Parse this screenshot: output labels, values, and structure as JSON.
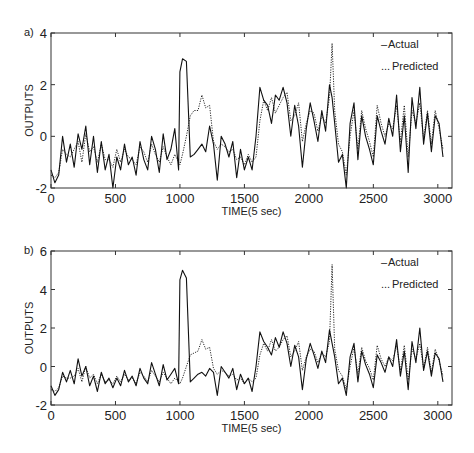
{
  "chart_data": [
    {
      "type": "line",
      "panel_label": "a)",
      "xlabel": "TIME(5 sec)",
      "ylabel": "OUTPUTS",
      "xlim": [
        0,
        3110
      ],
      "ylim": [
        -2,
        4
      ],
      "xticks": [
        0,
        500,
        1000,
        1500,
        2000,
        2500,
        3000
      ],
      "yticks": [
        -2,
        0,
        2,
        4
      ],
      "legend": {
        "placement": "top-right",
        "entries": [
          "Actual",
          "Predicted"
        ]
      },
      "legend_markers": [
        "–",
        "..."
      ],
      "x": [
        0,
        30,
        60,
        90,
        120,
        150,
        180,
        210,
        240,
        270,
        300,
        330,
        360,
        390,
        420,
        450,
        480,
        510,
        540,
        570,
        600,
        630,
        660,
        690,
        720,
        750,
        780,
        810,
        840,
        870,
        900,
        930,
        960,
        990,
        1000,
        1020,
        1050,
        1080,
        1110,
        1140,
        1170,
        1200,
        1230,
        1260,
        1290,
        1320,
        1350,
        1380,
        1410,
        1440,
        1470,
        1500,
        1530,
        1560,
        1590,
        1620,
        1650,
        1680,
        1710,
        1740,
        1770,
        1800,
        1830,
        1860,
        1890,
        1920,
        1950,
        1980,
        2010,
        2040,
        2070,
        2100,
        2130,
        2160,
        2180,
        2200,
        2230,
        2260,
        2290,
        2320,
        2350,
        2380,
        2410,
        2440,
        2470,
        2500,
        2530,
        2560,
        2590,
        2620,
        2650,
        2680,
        2710,
        2740,
        2770,
        2800,
        2830,
        2860,
        2890,
        2920,
        2950,
        2980,
        3010,
        3040
      ],
      "series": [
        {
          "name": "Actual",
          "style": "solid",
          "values": [
            -1.3,
            -1.8,
            -1.5,
            0,
            -1,
            -0.3,
            -1.2,
            0.1,
            -0.5,
            0.4,
            -1.1,
            0,
            -1.4,
            -0.2,
            -1.3,
            -0.7,
            -2.0,
            -0.8,
            -1.3,
            -0.3,
            -1.1,
            -0.8,
            -1.5,
            -0.2,
            -0.9,
            -1.3,
            0,
            -0.5,
            -1.4,
            0.1,
            -0.9,
            -0.5,
            0.3,
            -1.3,
            2.5,
            3.0,
            2.9,
            -0.8,
            -0.7,
            -0.5,
            -0.3,
            -0.6,
            0.4,
            -0.3,
            -1.7,
            0,
            -0.3,
            -0.8,
            -0.2,
            -1.6,
            -0.5,
            -1.3,
            -0.8,
            -1.3,
            0,
            1.9,
            1.4,
            1.2,
            0.5,
            1.6,
            1.4,
            1.9,
            1.3,
            0,
            1.2,
            0.4,
            -1.2,
            0.3,
            1.3,
            0.6,
            -0.2,
            1.0,
            0.2,
            2.0,
            1.5,
            0.5,
            -1.0,
            -0.7,
            -2.0,
            0.5,
            1.3,
            -0.9,
            0.8,
            0,
            -0.5,
            -1.1,
            0.8,
            0.2,
            -0.3,
            0.7,
            0,
            1.6,
            -0.6,
            0.8,
            -1.4,
            1.5,
            0.3,
            1.9,
            -0.3,
            0.9,
            -0.6,
            0.8,
            0.5,
            -0.8
          ]
        },
        {
          "name": "Predicted",
          "style": "dotted",
          "values": [
            -1.5,
            -1.6,
            -1.4,
            -0.5,
            -0.7,
            -0.8,
            -0.5,
            -0.2,
            -1,
            0.1,
            -0.6,
            -0.4,
            -1.0,
            -0.3,
            -0.9,
            -0.9,
            -1.2,
            -0.5,
            -1.0,
            -0.5,
            -0.8,
            -0.9,
            -1.1,
            -0.4,
            -0.6,
            -1.0,
            -0.3,
            -0.7,
            -1.0,
            -0.4,
            -0.8,
            -1.1,
            -0.7,
            -1.0,
            -1.1,
            -0.7,
            0,
            0.8,
            1.0,
            1.0,
            1.6,
            1.1,
            1.2,
            -0.2,
            -0.5,
            -0.3,
            -0.4,
            -0.6,
            -0.5,
            -0.9,
            -0.8,
            -1.1,
            -0.7,
            -1.0,
            -0.8,
            0.6,
            1.4,
            1.0,
            1.5,
            0.9,
            1.2,
            1.5,
            1.7,
            0.6,
            0.8,
            1.3,
            -0.2,
            0.5,
            1.0,
            0.9,
            0.2,
            0.8,
            0.5,
            1.5,
            3.6,
            1.0,
            -0.3,
            -0.6,
            -1.5,
            0,
            1.0,
            -0.5,
            1.0,
            0.3,
            -0.2,
            -0.8,
            1.2,
            0.5,
            0,
            0.5,
            0.3,
            1.2,
            -0.2,
            1.2,
            -0.8,
            1.0,
            0.5,
            1.3,
            -0.1,
            1.0,
            -0.3,
            1.0,
            0.3,
            -0.5
          ]
        }
      ]
    },
    {
      "type": "line",
      "panel_label": "b)",
      "xlabel": "TIME(5 sec)",
      "ylabel": "OUTPUTS",
      "xlim": [
        0,
        3110
      ],
      "ylim": [
        -2,
        6
      ],
      "xticks": [
        0,
        500,
        1000,
        1500,
        2000,
        2500,
        3000
      ],
      "yticks": [
        -2,
        0,
        2,
        4,
        6
      ],
      "legend": {
        "placement": "top-right",
        "entries": [
          "Actual",
          "Predicted"
        ]
      },
      "legend_markers": [
        "–",
        "..."
      ],
      "x": [
        0,
        30,
        60,
        90,
        120,
        150,
        180,
        210,
        240,
        270,
        300,
        330,
        360,
        390,
        420,
        450,
        480,
        510,
        540,
        570,
        600,
        630,
        660,
        690,
        720,
        750,
        780,
        810,
        840,
        870,
        900,
        930,
        960,
        990,
        1000,
        1020,
        1050,
        1080,
        1110,
        1140,
        1170,
        1200,
        1230,
        1260,
        1290,
        1320,
        1350,
        1380,
        1410,
        1440,
        1470,
        1500,
        1530,
        1560,
        1590,
        1620,
        1650,
        1680,
        1710,
        1740,
        1770,
        1800,
        1830,
        1860,
        1890,
        1920,
        1950,
        1980,
        2010,
        2040,
        2070,
        2100,
        2130,
        2160,
        2180,
        2200,
        2230,
        2260,
        2290,
        2320,
        2350,
        2380,
        2410,
        2440,
        2470,
        2500,
        2530,
        2560,
        2590,
        2620,
        2650,
        2680,
        2710,
        2740,
        2770,
        2800,
        2830,
        2860,
        2890,
        2920,
        2950,
        2980,
        3010,
        3040
      ],
      "series": [
        {
          "name": "Actual",
          "style": "solid",
          "values": [
            -1.0,
            -1.5,
            -1.2,
            -0.3,
            -0.8,
            -0.2,
            -0.9,
            0.4,
            -0.5,
            0,
            -1.0,
            -0.5,
            -1.3,
            -0.3,
            -0.9,
            -0.6,
            -1.1,
            -0.6,
            -1.0,
            -0.2,
            -0.8,
            -0.5,
            -1.0,
            -0.1,
            -0.6,
            -0.9,
            0.2,
            -0.4,
            -1.0,
            0.1,
            -0.7,
            -0.4,
            -0.1,
            -0.9,
            4.5,
            5.0,
            4.6,
            -0.8,
            -0.6,
            -0.4,
            -0.3,
            -0.5,
            -0.1,
            -0.3,
            -1.5,
            0,
            -0.3,
            -0.6,
            -0.1,
            -1.2,
            -0.4,
            -0.9,
            -0.6,
            -1.3,
            0,
            1.8,
            1.3,
            1.0,
            0.6,
            1.5,
            1.0,
            1.8,
            1.2,
            0,
            1.1,
            0.5,
            -1.2,
            0.4,
            1.2,
            0.6,
            -0.1,
            0.8,
            0.2,
            1.9,
            1.2,
            0.5,
            -0.9,
            -0.6,
            -1.5,
            0.5,
            1.2,
            -0.8,
            0.8,
            0.1,
            -0.4,
            -1.1,
            0.6,
            0.2,
            -0.3,
            0.5,
            0,
            1.4,
            -0.5,
            0.8,
            -1.2,
            1.3,
            0.2,
            2.0,
            -0.2,
            0.8,
            -0.5,
            0.7,
            0.4,
            -0.8
          ]
        },
        {
          "name": "Predicted",
          "style": "dotted",
          "values": [
            -1.2,
            -1.3,
            -1.1,
            -0.5,
            -0.6,
            -0.6,
            -0.5,
            -0.1,
            -0.8,
            0,
            -0.6,
            -0.4,
            -0.9,
            -0.4,
            -0.8,
            -0.7,
            -0.9,
            -0.5,
            -0.8,
            -0.4,
            -0.7,
            -0.6,
            -0.9,
            -0.3,
            -0.5,
            -0.8,
            -0.2,
            -0.5,
            -0.8,
            -0.3,
            -0.6,
            -0.9,
            -0.6,
            -0.8,
            -0.9,
            -0.6,
            0,
            0.6,
            0.7,
            0.8,
            1.4,
            0.9,
            1.0,
            -0.1,
            -0.4,
            -0.2,
            -0.3,
            -0.5,
            -0.4,
            -0.7,
            -0.6,
            -0.9,
            -0.6,
            -0.8,
            -0.6,
            0.6,
            1.2,
            0.8,
            1.4,
            0.8,
            1.0,
            1.4,
            1.6,
            0.5,
            0.8,
            1.3,
            -0.2,
            0.5,
            0.9,
            0.8,
            0.2,
            0.7,
            0.5,
            1.3,
            5.3,
            0.9,
            -0.2,
            -0.5,
            -1.2,
            0,
            1.0,
            -0.4,
            1.0,
            0.3,
            -0.1,
            -0.7,
            1.1,
            0.4,
            0,
            0.5,
            0.3,
            1.1,
            -0.2,
            1.1,
            -0.7,
            0.9,
            0.4,
            1.2,
            -0.1,
            1.0,
            -0.3,
            0.9,
            0.3,
            -0.5
          ]
        }
      ]
    }
  ]
}
